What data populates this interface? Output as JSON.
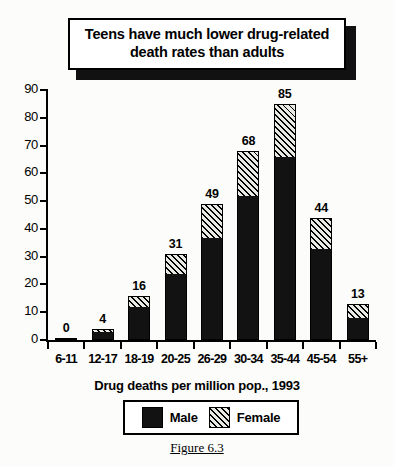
{
  "title": {
    "text": "Teens have much lower drug-related death rates than adults"
  },
  "x_axis_title": "Drug deaths per million pop., 1993",
  "figure_caption": "Figure 6.3",
  "legend": {
    "items": [
      {
        "label": "Male",
        "swatch": "solid-black-swatch",
        "color": "#121212"
      },
      {
        "label": "Female",
        "swatch": "diagonal-hatch-swatch",
        "color": "#e9e9e4"
      }
    ]
  },
  "chart_data": {
    "type": "bar",
    "stacked": true,
    "title": "Teens have much lower drug-related death rates than adults",
    "xlabel": "Drug deaths per million pop., 1993",
    "ylabel": "",
    "ylim": [
      0,
      90
    ],
    "yticks": [
      0,
      10,
      20,
      30,
      40,
      50,
      60,
      70,
      80,
      90
    ],
    "grid": false,
    "legend_position": "below-plot",
    "categories": [
      "6-11",
      "12-17",
      "18-19",
      "20-25",
      "26-29",
      "30-34",
      "35-44",
      "45-54",
      "55+"
    ],
    "series": [
      {
        "name": "Male",
        "values": [
          0,
          3,
          12,
          24,
          37,
          52,
          66,
          33,
          8
        ]
      },
      {
        "name": "Female",
        "values": [
          0,
          1,
          4,
          7,
          12,
          16,
          19,
          11,
          5
        ]
      }
    ],
    "totals": [
      0,
      4,
      16,
      31,
      49,
      68,
      85,
      44,
      13
    ],
    "data_labels": [
      "0",
      "4",
      "16",
      "31",
      "49",
      "68",
      "85",
      "44",
      "13"
    ]
  }
}
